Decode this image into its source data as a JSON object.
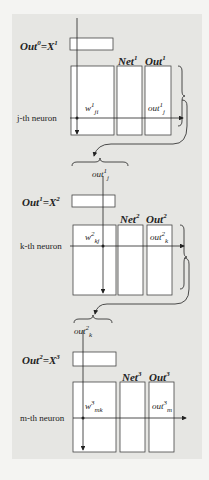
{
  "layers": [
    {
      "input_label": "Out",
      "input_sup": "0",
      "input_eq": "=X",
      "input_eq_sup": "1",
      "net_label": "Net",
      "net_sup": "1",
      "out_label": "Out",
      "out_sup": "1",
      "neuron_label": "j-th neuron",
      "weight": "w",
      "weight_sup": "1",
      "weight_sub": "ji",
      "output": "out",
      "output_sup": "1",
      "output_sub": "j"
    },
    {
      "input_label": "Out",
      "input_sup": "1",
      "input_eq": "=X",
      "input_eq_sup": "2",
      "net_label": "Net",
      "net_sup": "2",
      "out_label": "Out",
      "out_sup": "2",
      "neuron_label": "k-th neuron",
      "weight": "w",
      "weight_sup": "2",
      "weight_sub": "kj",
      "output": "out",
      "output_sup": "2",
      "output_sub": "k"
    },
    {
      "input_label": "Out",
      "input_sup": "2",
      "input_eq": "=X",
      "input_eq_sup": "3",
      "net_label": "Net",
      "net_sup": "3",
      "out_label": "Out",
      "out_sup": "3",
      "neuron_label": "m-th neuron",
      "weight": "w",
      "weight_sup": "3",
      "weight_sub": "mk",
      "output": "out",
      "output_sup": "3",
      "output_sub": "m"
    }
  ],
  "connectors": [
    {
      "label": "out",
      "sup": "1",
      "sub": "j"
    },
    {
      "label": "out",
      "sup": "2",
      "sub": "k"
    }
  ]
}
